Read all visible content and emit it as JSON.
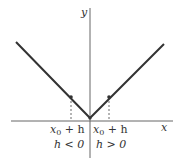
{
  "figure": {
    "axes": {
      "x_label": "x",
      "y_label": "y",
      "color": "#666666"
    },
    "curve": {
      "type": "absolute-value",
      "color": "#333333"
    },
    "points": [
      {
        "label_line1_var": "x",
        "label_line1_sub": "0",
        "label_line1_rest": " + h",
        "label_line2": "h < 0"
      },
      {
        "label_line1_var": "x",
        "label_line1_sub": "0",
        "label_line1_rest": " + h",
        "label_line2": "h > 0"
      }
    ]
  }
}
